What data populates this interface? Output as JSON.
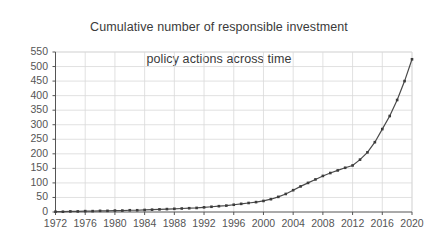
{
  "chart_data": {
    "type": "line",
    "title": "Cumulative number of responsible investment\npolicy actions across time",
    "title_line1": "Cumulative number of responsible investment",
    "title_line2": "policy actions across time",
    "xlabel": "",
    "ylabel": "",
    "xlim": [
      1972,
      2020
    ],
    "ylim": [
      0,
      550
    ],
    "grid": true,
    "legend": false,
    "legend_position": "none",
    "line_color": "#4a4a4a",
    "marker": "square",
    "marker_color": "#3c3c3c",
    "grid_color": "#d9d9d9",
    "axis_color": "#555555",
    "background": "#ffffff",
    "y_ticks": [
      0,
      50,
      100,
      150,
      200,
      250,
      300,
      350,
      400,
      450,
      500,
      550
    ],
    "y_tick_labels": [
      "0",
      "50",
      "100",
      "150",
      "200",
      "250",
      "300",
      "350",
      "400",
      "450",
      "500",
      "550"
    ],
    "x_ticks": [
      1972,
      1976,
      1980,
      1984,
      1988,
      1992,
      1996,
      2000,
      2004,
      2008,
      2012,
      2016,
      2020
    ],
    "x_tick_labels": [
      "1972",
      "1976",
      "1980",
      "1984",
      "1988",
      "1992",
      "1996",
      "2000",
      "2004",
      "2008",
      "2012",
      "2016",
      "2020"
    ],
    "x": [
      1972,
      1973,
      1974,
      1975,
      1976,
      1977,
      1978,
      1979,
      1980,
      1981,
      1982,
      1983,
      1984,
      1985,
      1986,
      1987,
      1988,
      1989,
      1990,
      1991,
      1992,
      1993,
      1994,
      1995,
      1996,
      1997,
      1998,
      1999,
      2000,
      2001,
      2002,
      2003,
      2004,
      2005,
      2006,
      2007,
      2008,
      2009,
      2010,
      2011,
      2012,
      2013,
      2014,
      2015,
      2016,
      2017,
      2018,
      2019,
      2020
    ],
    "values": [
      1,
      1,
      2,
      2,
      3,
      3,
      4,
      4,
      5,
      5,
      6,
      6,
      7,
      8,
      9,
      10,
      11,
      12,
      13,
      14,
      16,
      18,
      20,
      22,
      25,
      28,
      31,
      34,
      38,
      44,
      52,
      62,
      75,
      88,
      100,
      112,
      124,
      134,
      143,
      152,
      160,
      180,
      205,
      240,
      285,
      330,
      385,
      450,
      525
    ],
    "series_name": "Cumulative policy actions",
    "annotations": []
  }
}
